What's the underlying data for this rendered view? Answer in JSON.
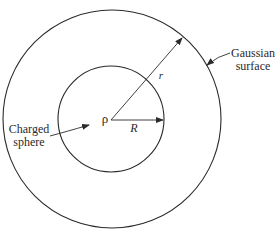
{
  "diagram": {
    "labels": {
      "gaussian_surface_line1": "Gaussian",
      "gaussian_surface_line2": "surface",
      "charged_sphere_line1": "Charged",
      "charged_sphere_line2": "sphere",
      "charge_density": "ρ",
      "sphere_radius": "R",
      "gaussian_radius": "r"
    },
    "shapes": {
      "outer_circle": {
        "cx": 112,
        "cy": 119,
        "r": 109,
        "represents": "Gaussian surface"
      },
      "inner_circle": {
        "cx": 111,
        "cy": 119,
        "r": 53,
        "represents": "Charged sphere"
      }
    },
    "colors": {
      "stroke": "#2a2a2a",
      "background": "#ffffff"
    }
  }
}
